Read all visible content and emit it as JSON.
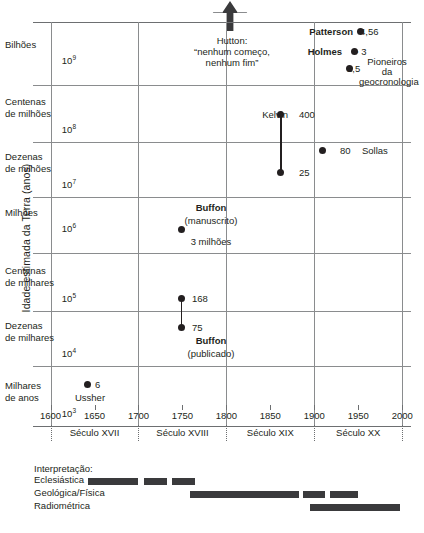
{
  "chart_data": {
    "type": "scatter",
    "title": "",
    "ylabel": "Idade estimada da Terra (anos)",
    "xlabel": "",
    "xlim": [
      1580,
      2010
    ],
    "grid": true,
    "xticks": [
      1600,
      1650,
      1700,
      1750,
      1800,
      1850,
      1900,
      1950,
      2000
    ],
    "xtick_labels": [
      "1600",
      "1650",
      "1700",
      "1750",
      "1800",
      "1850",
      "1900",
      "1950",
      "2000"
    ],
    "x_gridlines": [
      1600,
      1700,
      1800,
      1900,
      2000
    ],
    "y_bands": [
      {
        "name": "Bilhões",
        "power": "10",
        "exp": "9",
        "y_top": 22,
        "y_line": 85
      },
      {
        "name": "Centenas de milhões",
        "power": "10",
        "exp": "8",
        "y_top": 85,
        "y_line": 142
      },
      {
        "name": "Dezenas de milhões",
        "power": "10",
        "exp": "7",
        "y_top": 142,
        "y_line": 197
      },
      {
        "name": "Milhões",
        "power": "10",
        "exp": "6",
        "y_top": 197,
        "y_line": 253
      },
      {
        "name": "Centenas de milhares",
        "power": "10",
        "exp": "5",
        "y_top": 253,
        "y_line": 311
      },
      {
        "name": "Dezenas de milhares",
        "power": "10",
        "exp": "4",
        "y_top": 311,
        "y_line": 366
      },
      {
        "name": "Milhares de anos",
        "power": "10",
        "exp": "3",
        "y_top": 366,
        "y_line": 426
      }
    ],
    "centuries": [
      {
        "label": "Século XVII",
        "center": 1650
      },
      {
        "label": "Século XVIII",
        "center": 1750
      },
      {
        "label": "Século XIX",
        "center": 1850
      },
      {
        "label": "Século XX",
        "center": 1950
      }
    ],
    "points": [
      {
        "id": "ussher",
        "label": "6",
        "name": "Ussher",
        "value_text": "6",
        "x": 1642,
        "y_px": 384
      },
      {
        "id": "buffon-manuscrito",
        "label": "",
        "name": "Buffon",
        "value_text": "3 milhões",
        "x": 1749,
        "y_px": 229
      },
      {
        "id": "buffon-168",
        "label": "168",
        "name": "",
        "value_text": "168",
        "x": 1749,
        "y_px": 298
      },
      {
        "id": "buffon-75",
        "label": "75",
        "name": "Buffon",
        "value_text": "75",
        "x": 1749,
        "y_px": 327
      },
      {
        "id": "kelvin-400",
        "label": "400",
        "name": "Kelvin",
        "value_text": "400",
        "x": 1862,
        "y_px": 114
      },
      {
        "id": "kelvin-25",
        "label": "25",
        "name": "",
        "value_text": "25",
        "x": 1862,
        "y_px": 172
      },
      {
        "id": "sollas-80",
        "label": "80",
        "name": "Sollas",
        "value_text": "80",
        "x": 1909,
        "y_px": 150
      },
      {
        "id": "patterson",
        "label": "4,56",
        "name": "Patterson",
        "value_text": "4,56",
        "x": 1953,
        "y_px": 31
      },
      {
        "id": "holmes",
        "label": "> 3",
        "name": "Holmes",
        "value_text": "> 3",
        "x": 1946,
        "y_px": 51
      },
      {
        "id": "pioneiros-1-5",
        "label": "1,5",
        "name": "Pioneiros da geocronologia",
        "value_text": "1,5",
        "x": 1940,
        "y_px": 68
      }
    ],
    "connectors": [
      {
        "id": "kelvin-range",
        "x": 1862,
        "y_top_px": 114,
        "y_bottom_px": 172
      },
      {
        "id": "buffon-range",
        "x": 1749,
        "y_top_px": 298,
        "y_bottom_px": 327
      }
    ],
    "annotations": [
      {
        "id": "hutton",
        "name": "Hutton:",
        "line1": "“nenhum começo,",
        "line2": "nenhum fim”"
      },
      {
        "id": "buffon-manuscrito-note",
        "line1": "Buffon",
        "line2": "(manuscrito)",
        "line3": "3 milhões"
      },
      {
        "id": "buffon-publicado-note",
        "line1": "Buffon",
        "line2": "(publicado)"
      },
      {
        "id": "pioneiros-note",
        "line1": "Pioneiros",
        "line2": "da",
        "line3": "geocronologia"
      }
    ]
  },
  "interpretation": {
    "title": "Interpretação:",
    "rows": [
      {
        "label": "Eclesiástica",
        "segments": [
          {
            "left": 88,
            "width": 50
          },
          {
            "left": 144,
            "width": 23
          },
          {
            "left": 172,
            "width": 23
          }
        ]
      },
      {
        "label": "Geológica/Física",
        "segments": [
          {
            "left": 190,
            "width": 109
          },
          {
            "left": 303,
            "width": 22
          },
          {
            "left": 330,
            "width": 28
          }
        ]
      },
      {
        "label": "Radiométrica",
        "segments": [
          {
            "left": 310,
            "width": 90
          }
        ]
      }
    ]
  },
  "colors": {
    "ink": "#231f20",
    "grid": "#8a8c8e",
    "bar": "#3a3a3c",
    "background": "#ffffff"
  },
  "icons": {
    "up_arrow": "up-arrow-icon"
  }
}
